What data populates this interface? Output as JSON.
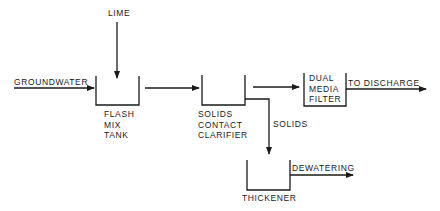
{
  "diagram": {
    "type": "process-flow",
    "nodes": [
      {
        "id": "flash_mix_tank",
        "lines": [
          "FLASH",
          "MIX",
          "TANK"
        ]
      },
      {
        "id": "solids_contact_clarifier",
        "lines": [
          "SOLIDS",
          "CONTACT",
          "CLARIFIER"
        ]
      },
      {
        "id": "dual_media_filter",
        "lines": [
          "DUAL",
          "MEDIA",
          "FILTER"
        ]
      },
      {
        "id": "thickener",
        "lines": [
          "THICKENER"
        ]
      }
    ],
    "inputs": {
      "groundwater": "GROUNDWATER",
      "lime": "LIME"
    },
    "outputs": {
      "discharge": "TO DISCHARGE",
      "dewatering": "DEWATERING"
    },
    "edge_labels": {
      "solids": "SOLIDS"
    },
    "edges": [
      {
        "from": "groundwater",
        "to": "flash_mix_tank"
      },
      {
        "from": "lime",
        "to": "flash_mix_tank"
      },
      {
        "from": "flash_mix_tank",
        "to": "solids_contact_clarifier"
      },
      {
        "from": "solids_contact_clarifier",
        "to": "dual_media_filter"
      },
      {
        "from": "solids_contact_clarifier",
        "to": "thickener",
        "label": "SOLIDS"
      },
      {
        "from": "dual_media_filter",
        "to": "discharge"
      },
      {
        "from": "thickener",
        "to": "dewatering"
      }
    ]
  },
  "colors": {
    "line": "#1a1a1a",
    "background": "#ffffff"
  }
}
